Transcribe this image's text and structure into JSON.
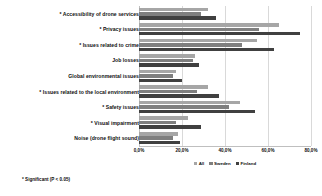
{
  "chart_data": {
    "type": "bar",
    "orientation": "horizontal",
    "title": "",
    "xlabel": "",
    "ylabel": "",
    "xlim": [
      0,
      80
    ],
    "grid": true,
    "legend_position": "bottom-center",
    "xticks": [
      "0,0%",
      "20,0%",
      "40,0%",
      "60,0%",
      "80,0%"
    ],
    "xtick_values": [
      0,
      20,
      40,
      60,
      80
    ],
    "categories": [
      "* Accessibility of drone services",
      "* Privacy issues",
      "* Issues related to crime",
      "Job losses",
      "Global environmental issues",
      "* Issues related to the local environment",
      "* Safety issues",
      "* Visual impairment",
      "Noise (drone flight sound)"
    ],
    "series": [
      {
        "name": "All",
        "color": "#a6a6a6",
        "values": [
          32.0,
          65.0,
          55.0,
          26.0,
          17.0,
          32.0,
          47.0,
          23.0,
          18.0
        ]
      },
      {
        "name": "Sweden",
        "color": "#7f7f7f",
        "values": [
          29.0,
          56.0,
          48.0,
          25.0,
          16.0,
          27.0,
          42.0,
          17.0,
          16.0
        ]
      },
      {
        "name": "Finland",
        "color": "#404040",
        "values": [
          36.0,
          75.0,
          63.0,
          28.0,
          20.0,
          37.0,
          54.0,
          29.0,
          19.0
        ]
      }
    ],
    "annotations": [
      "* Significant (P < 0.05)"
    ]
  },
  "footnote": "* Significant (P < 0.05)"
}
